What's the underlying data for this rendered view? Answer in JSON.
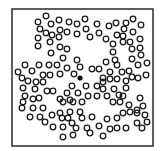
{
  "diagram": {
    "type": "particle-box",
    "background": "#ffffff",
    "stroke_color": "#1a1a1a",
    "frame": {
      "x": 12,
      "y": 9,
      "width": 141,
      "height": 137,
      "stroke_width": 1.4
    },
    "particle_radius": 2.8,
    "particle_stroke_width": 1.3,
    "highlight": {
      "x": 80,
      "y": 78,
      "r": 2.6,
      "fill": "#111111"
    },
    "particles": [
      [
        46,
        16
      ],
      [
        38,
        22
      ],
      [
        51,
        24
      ],
      [
        59,
        20
      ],
      [
        69,
        22
      ],
      [
        77,
        24
      ],
      [
        85,
        19
      ],
      [
        97,
        24
      ],
      [
        109,
        26
      ],
      [
        116,
        23
      ],
      [
        126,
        23
      ],
      [
        133,
        19
      ],
      [
        141,
        25
      ],
      [
        40,
        29
      ],
      [
        46,
        33
      ],
      [
        52,
        35
      ],
      [
        60,
        30
      ],
      [
        59,
        37
      ],
      [
        67,
        32
      ],
      [
        77,
        34
      ],
      [
        86,
        29
      ],
      [
        90,
        37
      ],
      [
        99,
        33
      ],
      [
        106,
        39
      ],
      [
        117,
        35
      ],
      [
        124,
        29
      ],
      [
        123,
        36
      ],
      [
        133,
        32
      ],
      [
        38,
        38
      ],
      [
        38,
        46
      ],
      [
        50,
        42
      ],
      [
        60,
        47
      ],
      [
        67,
        49
      ],
      [
        51,
        53
      ],
      [
        113,
        44
      ],
      [
        113,
        52
      ],
      [
        123,
        42
      ],
      [
        130,
        42
      ],
      [
        132,
        49
      ],
      [
        140,
        39
      ],
      [
        140,
        48
      ],
      [
        141,
        55
      ],
      [
        63,
        58
      ],
      [
        77,
        60
      ],
      [
        80,
        67
      ],
      [
        106,
        62
      ],
      [
        115,
        60
      ],
      [
        132,
        59
      ],
      [
        147,
        63
      ],
      [
        25,
        65
      ],
      [
        18,
        72
      ],
      [
        32,
        71
      ],
      [
        39,
        65
      ],
      [
        49,
        65
      ],
      [
        57,
        65
      ],
      [
        67,
        68
      ],
      [
        74,
        74
      ],
      [
        92,
        69
      ],
      [
        99,
        69
      ],
      [
        110,
        72
      ],
      [
        117,
        65
      ],
      [
        122,
        72
      ],
      [
        129,
        71
      ],
      [
        138,
        65
      ],
      [
        146,
        75
      ],
      [
        138,
        78
      ],
      [
        22,
        78
      ],
      [
        28,
        81
      ],
      [
        36,
        82
      ],
      [
        43,
        82
      ],
      [
        43,
        75
      ],
      [
        50,
        75
      ],
      [
        60,
        74
      ],
      [
        103,
        78
      ],
      [
        110,
        79
      ],
      [
        117,
        79
      ],
      [
        126,
        81
      ],
      [
        132,
        77
      ],
      [
        23,
        88
      ],
      [
        35,
        89
      ],
      [
        47,
        91
      ],
      [
        53,
        91
      ],
      [
        72,
        86
      ],
      [
        86,
        86
      ],
      [
        97,
        86
      ],
      [
        103,
        82
      ],
      [
        103,
        89
      ],
      [
        114,
        89
      ],
      [
        126,
        88
      ],
      [
        123,
        96
      ],
      [
        25,
        96
      ],
      [
        33,
        99
      ],
      [
        39,
        98
      ],
      [
        60,
        99
      ],
      [
        67,
        93
      ],
      [
        70,
        100
      ],
      [
        78,
        93
      ],
      [
        88,
        96
      ],
      [
        97,
        96
      ],
      [
        107,
        96
      ],
      [
        113,
        102
      ],
      [
        120,
        102
      ],
      [
        119,
        95
      ],
      [
        140,
        98
      ],
      [
        23,
        102
      ],
      [
        22,
        108
      ],
      [
        33,
        108
      ],
      [
        43,
        108
      ],
      [
        63,
        102
      ],
      [
        73,
        102
      ],
      [
        82,
        102
      ],
      [
        129,
        105
      ],
      [
        137,
        110
      ],
      [
        143,
        106
      ],
      [
        30,
        117
      ],
      [
        40,
        117
      ],
      [
        45,
        122
      ],
      [
        52,
        115
      ],
      [
        60,
        113
      ],
      [
        62,
        118
      ],
      [
        70,
        112
      ],
      [
        68,
        118
      ],
      [
        80,
        112
      ],
      [
        82,
        118
      ],
      [
        92,
        117
      ],
      [
        107,
        119
      ],
      [
        117,
        118
      ],
      [
        123,
        113
      ],
      [
        130,
        112
      ],
      [
        137,
        113
      ],
      [
        145,
        115
      ],
      [
        147,
        122
      ],
      [
        53,
        127
      ],
      [
        63,
        127
      ],
      [
        72,
        123
      ],
      [
        76,
        128
      ],
      [
        87,
        128
      ],
      [
        99,
        126
      ],
      [
        110,
        129
      ],
      [
        117,
        128
      ],
      [
        126,
        128
      ],
      [
        137,
        123
      ],
      [
        142,
        128
      ],
      [
        63,
        137
      ],
      [
        73,
        135
      ],
      [
        90,
        133
      ],
      [
        103,
        136
      ]
    ]
  }
}
